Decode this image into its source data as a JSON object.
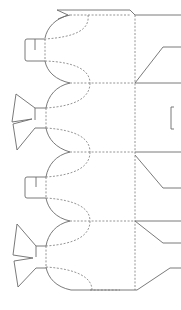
{
  "diagram": {
    "title": "Box die-cut template",
    "type": "dieline",
    "colors": {
      "cut_line": "#6b6b6b",
      "fold_line": "#7a7a7a",
      "background": "#ffffff"
    },
    "legend": {
      "cut": "solid line = cut",
      "fold": "dashed line = fold"
    },
    "panels": [
      {
        "name": "panel-1",
        "y_top": 15,
        "y_bottom": 83
      },
      {
        "name": "panel-2",
        "y_top": 83,
        "y_bottom": 152
      },
      {
        "name": "panel-3",
        "y_top": 152,
        "y_bottom": 221
      },
      {
        "name": "panel-4",
        "y_top": 221,
        "y_bottom": 290
      }
    ],
    "left_tabs": [
      {
        "type": "hook-tab",
        "y_center": 48
      },
      {
        "type": "bow-tab",
        "y_center": 117
      },
      {
        "type": "hook-tab",
        "y_center": 186
      },
      {
        "type": "bow-tab",
        "y_center": 255
      }
    ]
  }
}
